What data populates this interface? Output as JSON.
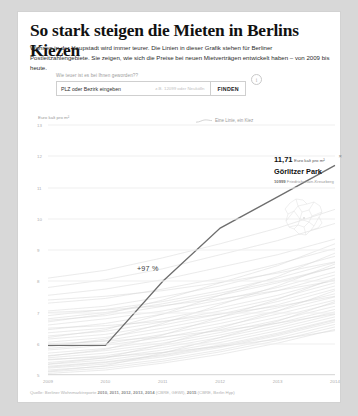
{
  "headline": "So stark steigen die Mieten in Berlins Kiezen",
  "intro": "Wohnen in der Haupstadt wird immer teurer. Die Linien in dieser Grafik stehen für Berliner Postleitzahlengebiete. Sie zeigen, wie sich die Preise bei neuen Mietverträgen entwickelt haben – von 2009 bis heute.",
  "search": {
    "label": "Wie teuer ist es bei Ihnen geworden??",
    "value": "PLZ oder Bezirk eingeben",
    "hint": "z.B. 12099 oder Neukölln",
    "button": "FINDEN",
    "info_icon": "i"
  },
  "tooltip": {
    "price": "11,71",
    "unit": "Euro kalt pro m²",
    "name": "Görlitzer Park",
    "plz": "10999",
    "district": "Friedrichshain-Kreuzberg",
    "close_icon": "×"
  },
  "annotation": "+97 %",
  "source_prefix": "Quelle: Berliner Wohnmarktreporte ",
  "source_years1": "2010, 2011, 2012, 2013, 2014",
  "source_mid": " (CBRE, GEWI), ",
  "source_years2": "2015",
  "source_suffix": " (CBRE, Berlin Hyp)",
  "chart_data": {
    "type": "line",
    "title": "So stark steigen die Mieten in Berlins Kiezen",
    "ylabel": "Euro kalt pro m²",
    "xlabel": "",
    "legend": "Eine Linie, ein Kiez",
    "legend_position": "top-center",
    "grid": true,
    "x": [
      "2009",
      "2010",
      "2011",
      "2012",
      "2013",
      "2014"
    ],
    "ylim": [
      5,
      13
    ],
    "yticks": [
      13,
      12,
      11,
      10,
      9,
      8,
      7,
      6,
      5
    ],
    "highlight": {
      "name": "Görlitzer Park",
      "values": [
        5.95,
        5.95,
        8.0,
        9.7,
        10.7,
        11.71
      ],
      "change_label": "+97 %",
      "color": "#6e6e6e"
    },
    "background_series_color": "#d9d9d9",
    "background_series": [
      {
        "name": "kiez-01",
        "values": [
          7.55,
          7.75,
          8.05,
          8.45,
          8.85,
          9.35
        ]
      },
      {
        "name": "kiez-02",
        "values": [
          7.3,
          7.45,
          7.75,
          8.1,
          8.55,
          9.05
        ]
      },
      {
        "name": "kiez-03",
        "values": [
          7.05,
          7.2,
          7.5,
          7.85,
          8.3,
          8.8
        ]
      },
      {
        "name": "kiez-04",
        "values": [
          6.9,
          7.1,
          7.35,
          7.7,
          8.1,
          8.6
        ]
      },
      {
        "name": "kiez-05",
        "values": [
          6.75,
          6.9,
          7.2,
          7.55,
          7.95,
          8.45
        ]
      },
      {
        "name": "kiez-06",
        "values": [
          6.6,
          6.8,
          7.05,
          7.4,
          7.8,
          8.3
        ]
      },
      {
        "name": "kiez-07",
        "values": [
          6.45,
          6.65,
          6.95,
          7.3,
          7.7,
          8.2
        ]
      },
      {
        "name": "kiez-08",
        "values": [
          6.35,
          6.5,
          6.8,
          7.15,
          7.55,
          8.05
        ]
      },
      {
        "name": "kiez-09",
        "values": [
          6.25,
          6.4,
          6.7,
          7.05,
          7.45,
          7.95
        ]
      },
      {
        "name": "kiez-10",
        "values": [
          6.15,
          6.3,
          6.6,
          6.95,
          7.35,
          7.85
        ]
      },
      {
        "name": "kiez-11",
        "values": [
          6.05,
          6.2,
          6.5,
          6.85,
          7.25,
          7.75
        ]
      },
      {
        "name": "kiez-12",
        "values": [
          5.95,
          6.1,
          6.4,
          6.75,
          7.15,
          7.6
        ]
      },
      {
        "name": "kiez-13",
        "values": [
          5.85,
          6.0,
          6.3,
          6.65,
          7.05,
          7.5
        ]
      },
      {
        "name": "kiez-14",
        "values": [
          5.8,
          5.95,
          6.2,
          6.55,
          6.95,
          7.4
        ]
      },
      {
        "name": "kiez-15",
        "values": [
          5.7,
          5.85,
          6.1,
          6.45,
          6.85,
          7.3
        ]
      },
      {
        "name": "kiez-16",
        "values": [
          5.62,
          5.78,
          6.02,
          6.36,
          6.75,
          7.2
        ]
      },
      {
        "name": "kiez-17",
        "values": [
          5.55,
          5.7,
          5.95,
          6.28,
          6.66,
          7.1
        ]
      },
      {
        "name": "kiez-18",
        "values": [
          5.48,
          5.62,
          5.88,
          6.2,
          6.58,
          7.02
        ]
      },
      {
        "name": "kiez-19",
        "values": [
          5.4,
          5.55,
          5.8,
          6.12,
          6.5,
          6.94
        ]
      },
      {
        "name": "kiez-20",
        "values": [
          5.34,
          5.48,
          5.72,
          6.04,
          6.42,
          6.86
        ]
      },
      {
        "name": "kiez-21",
        "values": [
          5.28,
          5.42,
          5.65,
          5.96,
          6.34,
          6.78
        ]
      },
      {
        "name": "kiez-22",
        "values": [
          5.22,
          5.35,
          5.58,
          5.88,
          6.26,
          6.7
        ]
      },
      {
        "name": "kiez-23",
        "values": [
          5.16,
          5.28,
          5.5,
          5.8,
          6.18,
          6.62
        ]
      },
      {
        "name": "kiez-24",
        "values": [
          5.1,
          5.22,
          5.44,
          5.74,
          6.1,
          6.54
        ]
      },
      {
        "name": "kiez-25",
        "values": [
          5.05,
          5.16,
          5.38,
          5.66,
          6.02,
          6.46
        ]
      },
      {
        "name": "kiez-26",
        "values": [
          7.8,
          8.05,
          8.4,
          8.85,
          9.3,
          9.85
        ]
      },
      {
        "name": "kiez-27",
        "values": [
          8.1,
          8.35,
          8.75,
          9.2,
          9.7,
          10.3
        ]
      },
      {
        "name": "kiez-28",
        "values": [
          6.7,
          6.95,
          7.4,
          7.95,
          8.5,
          9.2
        ]
      },
      {
        "name": "kiez-29",
        "values": [
          6.2,
          6.45,
          6.95,
          7.55,
          8.15,
          8.9
        ]
      },
      {
        "name": "kiez-30",
        "values": [
          5.9,
          6.15,
          6.65,
          7.25,
          7.85,
          8.55
        ]
      },
      {
        "name": "kiez-31",
        "values": [
          5.6,
          5.82,
          6.28,
          6.85,
          7.42,
          8.1
        ]
      },
      {
        "name": "kiez-32",
        "values": [
          5.35,
          5.55,
          5.98,
          6.5,
          7.05,
          7.7
        ]
      },
      {
        "name": "kiez-33",
        "values": [
          5.12,
          5.3,
          5.7,
          6.2,
          6.72,
          7.35
        ]
      },
      {
        "name": "kiez-34",
        "values": [
          6.5,
          6.58,
          6.72,
          6.95,
          7.2,
          7.52
        ]
      },
      {
        "name": "kiez-35",
        "values": [
          6.0,
          6.08,
          6.22,
          6.42,
          6.66,
          6.96
        ]
      },
      {
        "name": "kiez-36",
        "values": [
          5.5,
          5.58,
          5.72,
          5.92,
          6.14,
          6.42
        ]
      },
      {
        "name": "kiez-37",
        "values": [
          7.0,
          7.08,
          7.22,
          7.44,
          7.7,
          8.02
        ]
      },
      {
        "name": "kiez-38",
        "values": [
          7.4,
          7.52,
          7.7,
          7.96,
          8.26,
          8.62
        ]
      },
      {
        "name": "kiez-39",
        "values": [
          5.25,
          5.4,
          5.62,
          5.92,
          6.3,
          6.75
        ]
      },
      {
        "name": "kiez-40",
        "values": [
          6.8,
          7.0,
          7.28,
          7.62,
          8.0,
          8.45
        ]
      }
    ]
  }
}
